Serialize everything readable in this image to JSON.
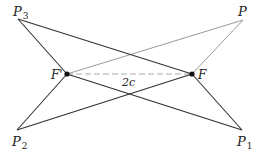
{
  "diagram": {
    "title": "",
    "colors": {
      "dark_line": "#333333",
      "light_line": "#9a9a9a",
      "dashed_line": "#aaaaaa",
      "focus_dot": "#111111",
      "background": "#ffffff"
    },
    "points": {
      "P": {
        "label": "P",
        "sub": "",
        "x": 243,
        "y": 20
      },
      "P1": {
        "label": "P",
        "sub": "1",
        "x": 242,
        "y": 130
      },
      "P2": {
        "label": "P",
        "sub": "2",
        "x": 17,
        "y": 130
      },
      "P3": {
        "label": "P",
        "sub": "3",
        "x": 18,
        "y": 19
      },
      "F": {
        "label": "F",
        "x": 192,
        "y": 74
      },
      "Fp": {
        "label": "F'",
        "x": 67,
        "y": 74
      }
    },
    "segments": [
      {
        "from": "P3",
        "to": "Fp",
        "style": "dark"
      },
      {
        "from": "P3",
        "to": "F",
        "style": "dark"
      },
      {
        "from": "P",
        "to": "Fp",
        "style": "light"
      },
      {
        "from": "P",
        "to": "F",
        "style": "light"
      },
      {
        "from": "P2",
        "to": "Fp",
        "style": "dark"
      },
      {
        "from": "P2",
        "to": "F",
        "style": "dark"
      },
      {
        "from": "P1",
        "to": "Fp",
        "style": "dark"
      },
      {
        "from": "P1",
        "to": "F",
        "style": "dark"
      },
      {
        "from": "Fp",
        "to": "F",
        "style": "dashed"
      }
    ],
    "distance_label": "2c"
  }
}
